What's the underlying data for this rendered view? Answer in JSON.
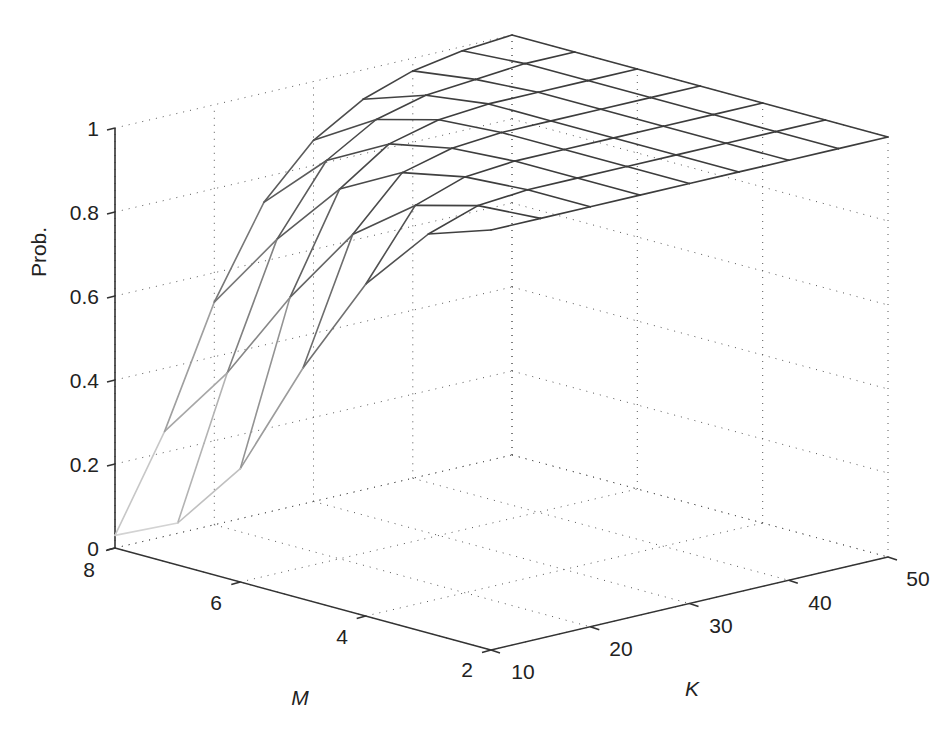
{
  "figure": {
    "background": "#ffffff",
    "axis_color": "#333333",
    "grid_color": "#555555",
    "mesh_color_low": "#dddddd",
    "mesh_color_high": "#3a3a3a"
  },
  "axes": {
    "z_label": "Prob.",
    "m_label": "M",
    "k_label": "K",
    "z_ticks": [
      "0",
      "0.2",
      "0.4",
      "0.6",
      "0.8",
      "1"
    ],
    "m_ticks": [
      "8",
      "6",
      "4",
      "2"
    ],
    "k_ticks": [
      "10",
      "20",
      "30",
      "40",
      "50"
    ]
  },
  "chart_data": {
    "type": "surface-mesh",
    "title": "",
    "xlabel": "M",
    "ylabel": "K",
    "zlabel": "Prob.",
    "x_name": "M",
    "y_name": "K",
    "M": [
      2,
      3,
      4,
      5,
      6,
      7,
      8
    ],
    "K": [
      10,
      15,
      20,
      25,
      30,
      35,
      40,
      45,
      50
    ],
    "Z": [
      [
        1.0,
        1.0,
        1.0,
        1.0,
        1.0,
        1.0,
        1.0,
        1.0,
        1.0
      ],
      [
        0.95,
        0.99,
        1.0,
        1.0,
        1.0,
        1.0,
        1.0,
        1.0,
        1.0
      ],
      [
        0.79,
        0.95,
        0.99,
        1.0,
        1.0,
        1.0,
        1.0,
        1.0,
        1.0
      ],
      [
        0.55,
        0.84,
        0.96,
        0.99,
        1.0,
        1.0,
        1.0,
        1.0,
        1.0
      ],
      [
        0.27,
        0.65,
        0.88,
        0.96,
        0.99,
        1.0,
        1.0,
        1.0,
        1.0
      ],
      [
        0.1,
        0.43,
        0.72,
        0.88,
        0.95,
        0.98,
        0.99,
        1.0,
        1.0
      ],
      [
        0.03,
        0.25,
        0.53,
        0.74,
        0.86,
        0.93,
        0.97,
        0.99,
        1.0
      ]
    ],
    "xlim": [
      2,
      8
    ],
    "ylim": [
      10,
      50
    ],
    "zlim": [
      0,
      1
    ],
    "x_ticks": [
      2,
      4,
      6,
      8
    ],
    "y_ticks": [
      10,
      20,
      30,
      40,
      50
    ],
    "z_ticks": [
      0,
      0.2,
      0.4,
      0.6,
      0.8,
      1
    ],
    "grid": true,
    "legend": null,
    "colormap": "gray (edge shade by height)"
  }
}
